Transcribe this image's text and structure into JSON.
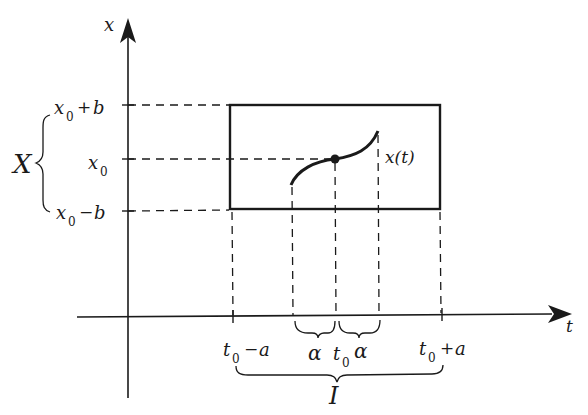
{
  "diagram": {
    "type": "existence-rectangle",
    "axes": {
      "vertical_label": "x",
      "horizontal_label": "t"
    },
    "vertical_ticks": [
      {
        "base": "x",
        "sub": "0",
        "op": "+",
        "tail": "b"
      },
      {
        "base": "x",
        "sub": "0",
        "op": "",
        "tail": ""
      },
      {
        "base": "x",
        "sub": "0",
        "op": "−",
        "tail": "b"
      }
    ],
    "horizontal_ticks": [
      {
        "base": "t",
        "sub": "0",
        "op": "−",
        "tail": "a"
      },
      {
        "base": "t",
        "sub": "0",
        "op": "",
        "tail": ""
      },
      {
        "base": "t",
        "sub": "0",
        "op": "+",
        "tail": "a"
      }
    ],
    "brace_labels": {
      "vertical_set": "X",
      "horizontal_set": "I",
      "alpha_left": "α",
      "alpha_right": "α"
    },
    "curve_label": "x(t)",
    "colors": {
      "ink": "#1a1a1a",
      "background": "#ffffff"
    }
  }
}
